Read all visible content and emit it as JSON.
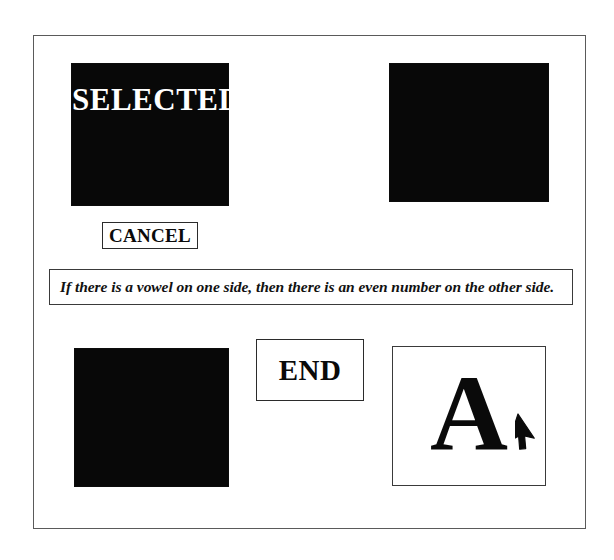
{
  "app": {
    "title": "Wason Selection Task",
    "background_color": "#ffffff",
    "frame_border_color": "#5a5a5a"
  },
  "statement": {
    "text": "If there is a vowel on one side, then there is an even number on the other side."
  },
  "buttons": [
    {
      "id": "cancel",
      "label": "CANCEL"
    },
    {
      "id": "end",
      "label": "END"
    }
  ],
  "cards": [
    {
      "id": "card-selected",
      "state": "selected",
      "face": "down",
      "label": "SELECTED",
      "label_color": "#ffffff",
      "fill_color": "#080808"
    },
    {
      "id": "card-topright",
      "state": "unselected",
      "face": "down",
      "label": "",
      "fill_color": "#080808"
    },
    {
      "id": "card-bottomleft",
      "state": "unselected",
      "face": "down",
      "label": "",
      "fill_color": "#080808"
    },
    {
      "id": "card-vowel-a",
      "state": "revealed",
      "face": "up",
      "label": "A",
      "label_color": "#0a0a0a",
      "fill_color": "#ffffff"
    }
  ],
  "cursor": {
    "icon": "arrow-pointer-icon",
    "x": 515,
    "y": 413
  }
}
